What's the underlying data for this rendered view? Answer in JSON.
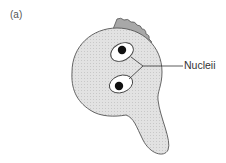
{
  "figure": {
    "panel_label": "(a)",
    "labels": {
      "nuclei": "Nucleii"
    },
    "colors": {
      "cell_fill": "#dcdcdc",
      "wall_fill": "#a8a8a8",
      "outline": "#555555",
      "nucleus_fill": "#ffffff",
      "nucleolus": "#111111"
    }
  }
}
